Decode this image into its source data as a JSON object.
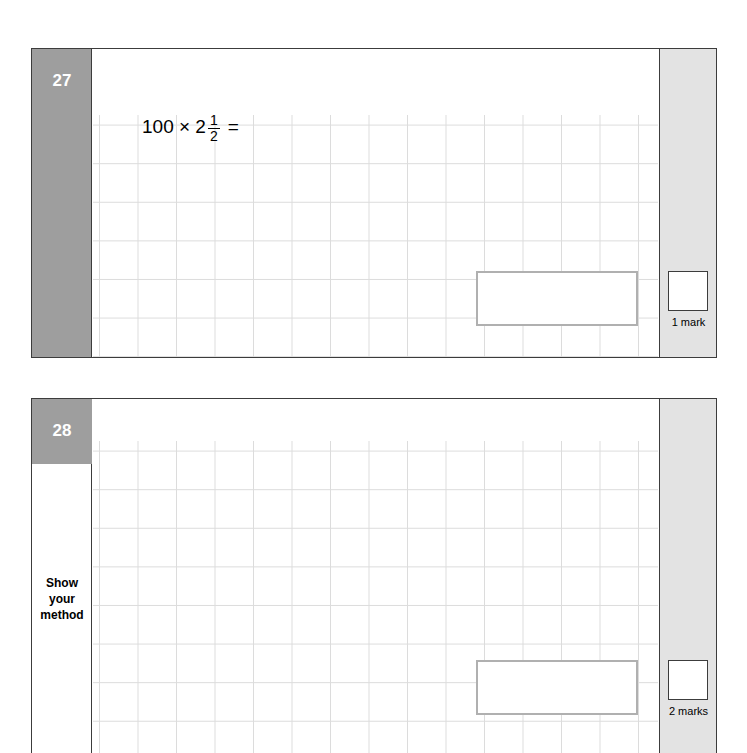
{
  "page": {
    "background": "#ffffff",
    "grid_color": "#dcdcdc",
    "rule_color": "#3c3c3c",
    "number_band_color": "#9e9e9e",
    "marks_column_color": "#e3e3e3",
    "answer_box_border": "#b0b0b0"
  },
  "questions": [
    {
      "number": "27",
      "expression": {
        "whole_left": "100 × 2",
        "fraction_numerator": "1",
        "fraction_denominator": "2",
        "equals": "="
      },
      "marks_label": "1 mark",
      "answer_value": ""
    },
    {
      "number": "28",
      "instruction_line1": "Show",
      "instruction_line2": "your",
      "instruction_line3": "method",
      "division": {
        "divisor": "2 2",
        "dividend": "7 0 4"
      },
      "marks_label": "2 marks",
      "answer_value": ""
    }
  ],
  "ghost_text": {
    "line1": "",
    "line2": ""
  }
}
